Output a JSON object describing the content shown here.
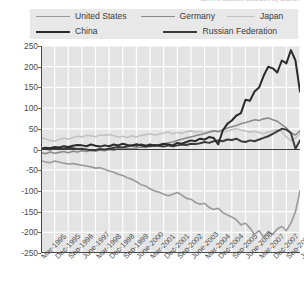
{
  "header": {
    "clipped_caption": "current account balances by quarter"
  },
  "legend": {
    "position": "top",
    "rows": [
      [
        {
          "label": "United States",
          "color": "#9a9a9a",
          "width": 1.6
        },
        {
          "label": "Germany",
          "color": "#8a8a8a",
          "width": 1.6
        },
        {
          "label": "Japan",
          "color": "#c2c2c2",
          "width": 1.6
        }
      ],
      [
        {
          "label": "China",
          "color": "#2b2b2b",
          "width": 2.0
        },
        {
          "label": "Russian Federation",
          "color": "#3b3b3b",
          "width": 2.0
        }
      ]
    ]
  },
  "chart_data": {
    "type": "line",
    "title": "",
    "xlabel": "",
    "ylabel": "",
    "ylim": [
      -250,
      250
    ],
    "ytick_step": 50,
    "ytick_labels": [
      "250",
      "200",
      "150",
      "100",
      "50",
      "0",
      "-50",
      "-100",
      "-150",
      "-200",
      "-250"
    ],
    "grid": true,
    "grid_color": "#ffffff",
    "plot_bg": "#e4e4e4",
    "zero_line": true,
    "x_tick_labels": [
      "Mar-1995",
      "Dec-1995",
      "Sep-1996",
      "June-1997",
      "Mar-1998",
      "Dec-1998",
      "Sep-1999",
      "June-2000",
      "Mar-2001",
      "Dec-2001",
      "Sep-2002",
      "June-2003",
      "Mar-2004",
      "Dec-2004",
      "Sep-2005",
      "June-2006",
      "Mar-2007",
      "Dec-2007",
      "Sep-2008",
      "June-2009"
    ],
    "x_points": 58,
    "series": [
      {
        "name": "United States",
        "color": "#9a9a9a",
        "width": 1.6,
        "values": [
          -27,
          -30,
          -32,
          -28,
          -30,
          -33,
          -35,
          -34,
          -36,
          -38,
          -40,
          -42,
          -45,
          -44,
          -48,
          -52,
          -55,
          -60,
          -63,
          -68,
          -72,
          -78,
          -85,
          -88,
          -95,
          -100,
          -103,
          -108,
          -112,
          -108,
          -104,
          -110,
          -118,
          -120,
          -128,
          -132,
          -130,
          -140,
          -145,
          -142,
          -152,
          -158,
          -163,
          -170,
          -182,
          -178,
          -190,
          -205,
          -196,
          -212,
          -198,
          -205,
          -192,
          -186,
          -196,
          -178,
          -150,
          -100
        ]
      },
      {
        "name": "Germany",
        "color": "#8a8a8a",
        "width": 1.6,
        "values": [
          -8,
          -10,
          -6,
          -9,
          -7,
          -5,
          -8,
          -4,
          -6,
          -3,
          -5,
          -2,
          -4,
          -1,
          -3,
          0,
          -2,
          2,
          0,
          3,
          1,
          4,
          6,
          5,
          8,
          10,
          9,
          13,
          16,
          18,
          22,
          25,
          28,
          30,
          33,
          36,
          38,
          42,
          45,
          43,
          48,
          52,
          55,
          58,
          62,
          65,
          68,
          72,
          70,
          74,
          76,
          72,
          68,
          60,
          52,
          40,
          35,
          45
        ]
      },
      {
        "name": "Japan",
        "color": "#c2c2c2",
        "width": 1.6,
        "values": [
          28,
          26,
          22,
          20,
          24,
          27,
          25,
          29,
          32,
          30,
          34,
          33,
          31,
          35,
          34,
          36,
          33,
          30,
          32,
          29,
          33,
          31,
          34,
          36,
          38,
          35,
          37,
          40,
          42,
          38,
          41,
          39,
          43,
          45,
          42,
          44,
          41,
          43,
          46,
          44,
          42,
          45,
          48,
          50,
          47,
          45,
          42,
          44,
          41,
          38,
          42,
          45,
          48,
          44,
          30,
          22,
          28,
          38
        ]
      },
      {
        "name": "China",
        "color": "#2b2b2b",
        "width": 2.0,
        "values": [
          2,
          4,
          3,
          6,
          5,
          8,
          6,
          9,
          11,
          10,
          8,
          12,
          9,
          7,
          10,
          8,
          12,
          10,
          14,
          11,
          9,
          13,
          10,
          8,
          12,
          9,
          11,
          14,
          12,
          10,
          16,
          14,
          18,
          22,
          20,
          26,
          24,
          30,
          28,
          12,
          46,
          62,
          70,
          82,
          88,
          120,
          118,
          140,
          150,
          178,
          200,
          196,
          186,
          215,
          208,
          240,
          215,
          140
        ]
      },
      {
        "name": "Russian Federation",
        "color": "#3b3b3b",
        "width": 2.0,
        "values": [
          1,
          2,
          0,
          3,
          1,
          2,
          4,
          3,
          1,
          2,
          0,
          -2,
          -1,
          1,
          0,
          2,
          4,
          6,
          5,
          8,
          10,
          9,
          12,
          10,
          8,
          11,
          9,
          7,
          10,
          8,
          10,
          12,
          11,
          14,
          13,
          15,
          18,
          16,
          20,
          22,
          20,
          24,
          23,
          26,
          20,
          18,
          22,
          20,
          24,
          28,
          32,
          38,
          44,
          50,
          48,
          40,
          2,
          22
        ]
      }
    ]
  }
}
